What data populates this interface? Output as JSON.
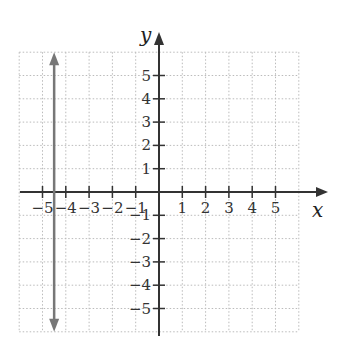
{
  "chart_data": {
    "type": "line",
    "title": "",
    "xlabel": "x",
    "ylabel": "y",
    "xlim": [
      -6,
      6
    ],
    "ylim": [
      -6,
      6
    ],
    "grid": true,
    "grid_style": "dotted",
    "x_ticks": [
      -5,
      -4,
      -3,
      -2,
      -1,
      1,
      2,
      3,
      4,
      5
    ],
    "y_ticks": [
      -5,
      -4,
      -3,
      -2,
      -1,
      1,
      2,
      3,
      4,
      5
    ],
    "x_tick_labels": [
      "−5",
      "−4",
      "−3",
      "−2",
      "−1",
      "1",
      "2",
      "3",
      "4",
      "5"
    ],
    "y_tick_labels": [
      "−5",
      "−4",
      "−3",
      "−2",
      "−1",
      "1",
      "2",
      "3",
      "4",
      "5"
    ],
    "series": [
      {
        "name": "x = -4.5",
        "kind": "vertical-line",
        "x": [
          -4.5,
          -4.5
        ],
        "y": [
          -6,
          6
        ],
        "arrows": "both",
        "color": "#777777"
      }
    ],
    "legend": null
  },
  "colors": {
    "axis": "#333333",
    "grid": "#bbbbbb",
    "line": "#777777"
  }
}
